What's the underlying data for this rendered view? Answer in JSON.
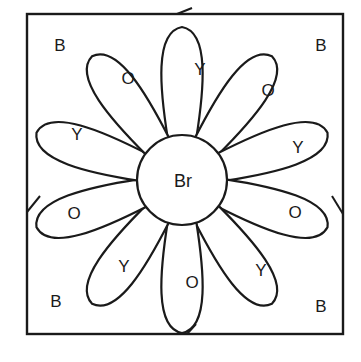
{
  "diagram": {
    "type": "color-by-letter flower",
    "center": {
      "label": "Br"
    },
    "petals": [
      {
        "position": "top",
        "label": "Y"
      },
      {
        "position": "upper-right",
        "label": "O"
      },
      {
        "position": "right-upper",
        "label": "Y"
      },
      {
        "position": "right-lower",
        "label": "O"
      },
      {
        "position": "lower-right",
        "label": "Y"
      },
      {
        "position": "bottom",
        "label": "O"
      },
      {
        "position": "lower-left",
        "label": "Y"
      },
      {
        "position": "left-lower",
        "label": "O"
      },
      {
        "position": "left-upper",
        "label": "Y"
      },
      {
        "position": "upper-left",
        "label": "O"
      }
    ],
    "corners": {
      "top_left": "B",
      "top_right": "B",
      "bottom_left": "B",
      "bottom_right": "B"
    },
    "colors": {
      "line": "#1a1a1a",
      "background": "#ffffff"
    }
  }
}
